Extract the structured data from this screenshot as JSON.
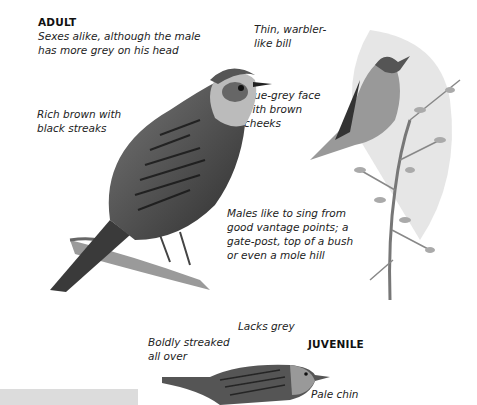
{
  "adult": {
    "heading": "ADULT",
    "intro_line1": "Sexes alike, although the male",
    "intro_line2": "has more grey on his head",
    "bill_line1": "Thin, warbler-",
    "bill_line2": "like bill",
    "body_line1": "Rich brown with",
    "body_line2": "black streaks",
    "face_line1": "Blue-grey face",
    "face_line2": "with brown",
    "face_line3": "cheeks"
  },
  "singing": {
    "line1": "Males like to sing from",
    "line2": "good vantage points; a",
    "line3": "gate-post, top of a bush",
    "line4": "or even a mole hill"
  },
  "juvenile": {
    "heading": "JUVENILE",
    "lacks": "Lacks grey",
    "streak_line1": "Boldly streaked",
    "streak_line2": "all over",
    "chin": "Pale chin"
  },
  "illustrations": {
    "adult_bird": "adult-perched-bird",
    "singing_bird": "singing-bird-on-bush",
    "juvenile_bird": "juvenile-bird"
  }
}
